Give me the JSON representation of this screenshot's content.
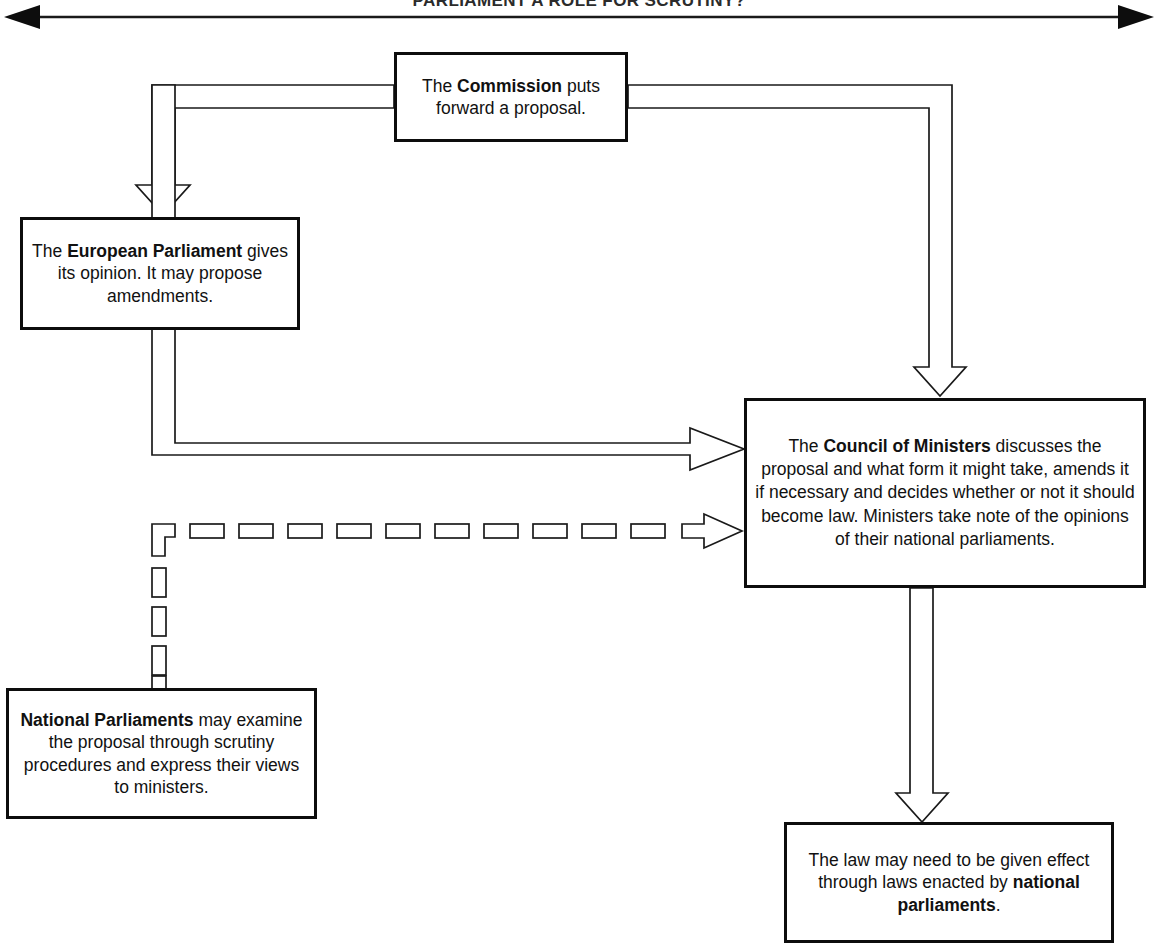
{
  "title": "PARLIAMENT A ROLE FOR SCRUTINY?",
  "diagram": {
    "type": "flowchart",
    "orientation": "top-down",
    "header_axis": {
      "name": "double-headed-arrow",
      "style": "solid",
      "direction": "both"
    },
    "nodes": [
      {
        "id": "commission",
        "label": "The Commission puts forward a proposal.",
        "bold_segment": "Commission",
        "text_before": "The ",
        "text_after": " puts forward a proposal."
      },
      {
        "id": "parliament",
        "label": "The European Parliament gives its opinion. It may propose amendments.",
        "bold_segment": "European Parliament",
        "text_before": "The ",
        "text_after": " gives its opinion. It may propose amendments."
      },
      {
        "id": "council",
        "label": "The Council of Ministers discusses the proposal and what form it might take, amends it if necessary and decides whether or not it should become law. Ministers take note of the opinions of their national parliaments.",
        "bold_segment": "Council of Ministers",
        "text_before": "The ",
        "text_after": " discusses the proposal and what form it might take, amends it if necessary and decides whether or not it should become law. Ministers take note of the opinions of their national parliaments."
      },
      {
        "id": "national",
        "label": "National Parliaments may examine the proposal through scrutiny procedures and express their views to ministers.",
        "bold_segment": "National Parliaments",
        "text_before": "",
        "text_after": " may examine the proposal through scrutiny procedures and express their views to ministers."
      },
      {
        "id": "law",
        "label": "The law may need to be given effect through laws enacted by national parliaments.",
        "bold_segment": "national parliaments",
        "text_before": "The law may need to be given effect through laws enacted by ",
        "text_after": "."
      }
    ],
    "edges": [
      {
        "id": "commission-to-parliament",
        "from": "commission",
        "to": "parliament",
        "style": "hollow-block-arrow",
        "route": "left-down"
      },
      {
        "id": "commission-to-council-top",
        "from": "commission",
        "to": "council",
        "style": "hollow-block-arrow",
        "route": "right-down"
      },
      {
        "id": "commission-to-council-left",
        "from": "commission",
        "to": "council",
        "style": "hollow-block-arrow",
        "route": "left-down-right"
      },
      {
        "id": "national-to-council",
        "from": "national",
        "to": "council",
        "style": "dashed-hollow-block-arrow",
        "route": "up-right"
      },
      {
        "id": "council-to-law",
        "from": "council",
        "to": "law",
        "style": "hollow-block-arrow",
        "route": "down"
      }
    ],
    "colors": {
      "line": "#111111",
      "box_border": "#0d0d0d",
      "background": "#ffffff",
      "text": "#111111"
    }
  }
}
